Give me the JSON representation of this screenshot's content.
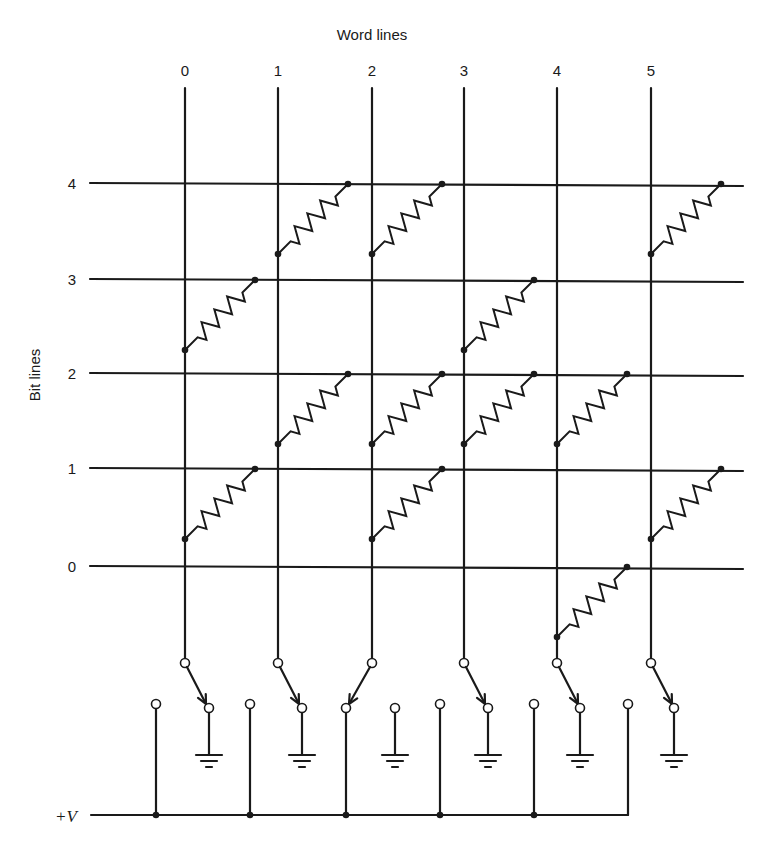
{
  "figure": {
    "word_lines_title": "Word lines",
    "bit_lines_title": "Bit lines",
    "supply_label": "+V",
    "caption_visible": false
  },
  "word_lines": [
    {
      "label": "0",
      "x": 185
    },
    {
      "label": "1",
      "x": 278
    },
    {
      "label": "2",
      "x": 372
    },
    {
      "label": "3",
      "x": 464
    },
    {
      "label": "4",
      "x": 557
    },
    {
      "label": "5",
      "x": 651
    }
  ],
  "bit_lines": [
    {
      "label": "4",
      "y": 183
    },
    {
      "label": "3",
      "y": 279
    },
    {
      "label": "2",
      "y": 373
    },
    {
      "label": "1",
      "y": 468
    },
    {
      "label": "0",
      "y": 566
    }
  ],
  "resistors": [
    {
      "word": 0,
      "bit": 3
    },
    {
      "word": 0,
      "bit": 1
    },
    {
      "word": 1,
      "bit": 4
    },
    {
      "word": 1,
      "bit": 2
    },
    {
      "word": 2,
      "bit": 4
    },
    {
      "word": 2,
      "bit": 2
    },
    {
      "word": 2,
      "bit": 1
    },
    {
      "word": 3,
      "bit": 3
    },
    {
      "word": 3,
      "bit": 2
    },
    {
      "word": 4,
      "bit": 2
    },
    {
      "word": 4,
      "bit": 0
    },
    {
      "word": 5,
      "bit": 4
    },
    {
      "word": 5,
      "bit": 1
    }
  ],
  "switches": [
    {
      "word": 0,
      "position": "ground"
    },
    {
      "word": 1,
      "position": "ground"
    },
    {
      "word": 2,
      "position": "supply"
    },
    {
      "word": 3,
      "position": "ground"
    },
    {
      "word": 4,
      "position": "ground"
    },
    {
      "word": 5,
      "position": "ground"
    }
  ],
  "colors": {
    "ink": "#1a1a1a",
    "paper": "#ffffff"
  }
}
